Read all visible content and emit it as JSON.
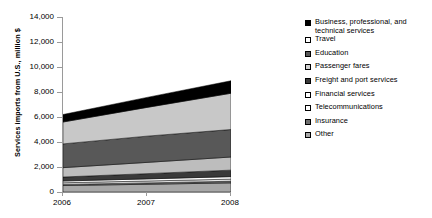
{
  "chart_data": {
    "type": "area",
    "title": "",
    "xlabel": "",
    "ylabel": "Services imports from U.S., million $",
    "x": [
      "2006",
      "2007",
      "2008"
    ],
    "categories": [
      "2006",
      "2007",
      "2008"
    ],
    "ylim": [
      0,
      14000
    ],
    "yticks": [
      "0",
      "2,000",
      "4,000",
      "6,000",
      "8,000",
      "10,000",
      "12,000",
      "14,000"
    ],
    "ytick_values": [
      0,
      2000,
      4000,
      6000,
      8000,
      10000,
      12000,
      14000
    ],
    "grid": false,
    "legend_position": "right",
    "stacked": true,
    "stack_order_bottom_to_top": [
      "Other",
      "Insurance",
      "Telecommunications",
      "Financial services",
      "Freight and port services",
      "Passenger fares",
      "Education",
      "Travel",
      "Business, professional, and technical services"
    ],
    "series": [
      {
        "name": "Business, professional, and technical services",
        "color": "#000000",
        "values": [
          600,
          800,
          1000
        ]
      },
      {
        "name": "Travel",
        "color": "#c8c8c8",
        "values": [
          1750,
          2300,
          2900
        ]
      },
      {
        "name": "Education",
        "color": "#585858",
        "values": [
          1900,
          2100,
          2200
        ]
      },
      {
        "name": "Passenger fares",
        "color": "#bdbdbd",
        "values": [
          750,
          900,
          1050
        ]
      },
      {
        "name": "Freight and port services",
        "color": "#3a3a3a",
        "values": [
          320,
          420,
          520
        ]
      },
      {
        "name": "Financial services",
        "color": "#ffffff",
        "values": [
          140,
          170,
          200
        ]
      },
      {
        "name": "Telecommunications",
        "color": "#e6e6e6",
        "values": [
          130,
          150,
          170
        ]
      },
      {
        "name": "Insurance",
        "color": "#6e6e6e",
        "values": [
          90,
          110,
          130
        ]
      },
      {
        "name": "Other",
        "color": "#a8a8a8",
        "values": [
          520,
          620,
          730
        ]
      }
    ],
    "totals": [
      6200,
      7600,
      8900
    ]
  },
  "axes": {
    "y_title": "Services imports from U.S., million $",
    "y_ticks": [
      "14,000",
      "12,000",
      "10,000",
      "8,000",
      "6,000",
      "4,000",
      "2,000",
      "0"
    ],
    "x_ticks": [
      "2006",
      "2007",
      "2008"
    ]
  },
  "legend": {
    "items": [
      {
        "label": "Business, professional, and technical services",
        "swatch": "#000000"
      },
      {
        "label": "Travel",
        "swatch": "#ffffff"
      },
      {
        "label": "Education",
        "swatch": "#585858"
      },
      {
        "label": "Passenger fares",
        "swatch": "#d0d0d0"
      },
      {
        "label": "Freight and port services",
        "swatch": "#3a3a3a"
      },
      {
        "label": "Financial services",
        "swatch": "#ffffff"
      },
      {
        "label": "Telecommunications",
        "swatch": "#ffffff"
      },
      {
        "label": "Insurance",
        "swatch": "#6e6e6e"
      },
      {
        "label": "Other",
        "swatch": "#a8a8a8"
      }
    ]
  }
}
